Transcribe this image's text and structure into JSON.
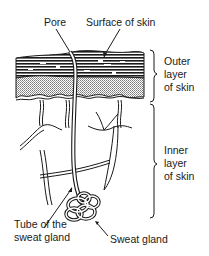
{
  "diagram": {
    "type": "anatomical-cross-section",
    "labels": {
      "pore": "Pore",
      "surface": "Surface of skin",
      "outer_layer": [
        "Outer",
        "layer",
        "of skin"
      ],
      "inner_layer": [
        "Inner",
        "layer",
        "of skin"
      ],
      "tube": [
        "Tube of the",
        "sweat gland"
      ],
      "gland": "Sweat gland"
    },
    "colors": {
      "ink": "#1a1a1a",
      "background": "#ffffff",
      "stipple": "#9a9a9a"
    }
  }
}
